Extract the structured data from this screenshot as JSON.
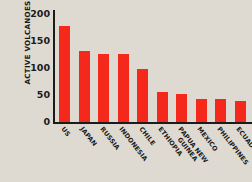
{
  "chart_data": {
    "type": "bar",
    "title": "",
    "xlabel": "",
    "ylabel": "ACTIVE VOLCANOES",
    "ylim": [
      0,
      200
    ],
    "yticks": [
      0,
      50,
      100,
      150,
      200
    ],
    "grid": false,
    "legend": null,
    "bar_color": "#f4291b",
    "background_color": "#dedad2",
    "categories": [
      "US",
      "JAPAN",
      "RUSSIA",
      "INDONESIA",
      "CHILE",
      "ETHIOPIA",
      "PAPUA NEW GUINEA",
      "MEXICO",
      "PHILIPPINES",
      "ECUADOR"
    ],
    "values": [
      177,
      132,
      126,
      126,
      99,
      56,
      51,
      43,
      42,
      38
    ]
  }
}
